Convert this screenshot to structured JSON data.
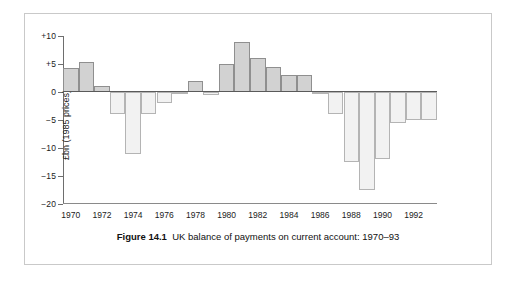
{
  "figure": {
    "caption_label": "Figure 14.1",
    "caption_text": "UK balance of payments on current account: 1970–93"
  },
  "chart_data": {
    "type": "bar",
    "title": "UK balance of payments on current account: 1970–93",
    "xlabel": "",
    "ylabel": "£bn (1985 prices)",
    "ylim": [
      -20,
      10
    ],
    "yticks": [
      10,
      5,
      0,
      -5,
      -10,
      -15,
      -20
    ],
    "ytick_labels": [
      "+10",
      "+5",
      "0",
      "−5",
      "−10",
      "−15",
      "−20"
    ],
    "grid": false,
    "legend": "none",
    "categories": [
      "1970",
      "1971",
      "1972",
      "1973",
      "1974",
      "1975",
      "1976",
      "1977",
      "1978",
      "1979",
      "1980",
      "1981",
      "1982",
      "1983",
      "1984",
      "1985",
      "1986",
      "1987",
      "1988",
      "1989",
      "1990",
      "1991",
      "1992",
      "1993"
    ],
    "xtick_labels": [
      "1970",
      "1972",
      "1974",
      "1976",
      "1978",
      "1980",
      "1982",
      "1984",
      "1986",
      "1988",
      "1990",
      "1992"
    ],
    "values": [
      4.3,
      5.3,
      1.0,
      -4.0,
      -11.0,
      -4.0,
      -2.0,
      -0.3,
      2.0,
      -0.5,
      5.0,
      9.0,
      6.0,
      4.5,
      3.0,
      3.0,
      -0.2,
      -4.0,
      -12.5,
      -17.5,
      -12.0,
      -5.5,
      -5.0,
      -5.0
    ],
    "colors": {
      "positive_fill": "#d2d2d2",
      "negative_fill": "#f2f2f2",
      "bar_outline": "#9a9a9a",
      "axis": "#6e6e6e",
      "text": "#1b1b1b"
    }
  }
}
